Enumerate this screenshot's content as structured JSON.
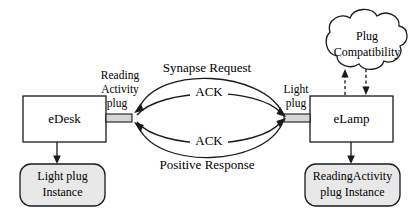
{
  "diagram": {
    "colors": {
      "stroke": "#1a1a1a",
      "box_fill": "#ffffff",
      "instance_fill": "#e8e8e8",
      "plug_fill": "#d6d6d6",
      "background": "#ffffff"
    },
    "components": [
      {
        "id": "edesk",
        "label": "eDesk",
        "shape": "rectangle"
      },
      {
        "id": "elamp",
        "label": "eLamp",
        "shape": "rectangle"
      }
    ],
    "instances": [
      {
        "id": "light-plug-instance",
        "line1": "Light plug",
        "line2": "Instance",
        "shape": "rounded-rectangle"
      },
      {
        "id": "reading-activity-plug-instance",
        "line1": "ReadingActivity",
        "line2": "plug Instance",
        "shape": "rounded-rectangle"
      }
    ],
    "cloud": {
      "id": "plug-compatibility",
      "line1": "Plug",
      "line2": "Compatibility",
      "shape": "cloud"
    },
    "plugs": [
      {
        "id": "reading-activity-plug",
        "line1": "Reading",
        "line2": "Activity",
        "line3": "plug",
        "attached_to": "edesk"
      },
      {
        "id": "light-plug",
        "line1": "Light",
        "line2": "plug",
        "attached_to": "elamp"
      }
    ],
    "messages": [
      {
        "id": "synapse-request",
        "label": "Synapse Request",
        "direction": "right-to-left",
        "position": "outer-top"
      },
      {
        "id": "ack-top",
        "label": "ACK",
        "direction": "left-to-right",
        "position": "inner-top"
      },
      {
        "id": "ack-bottom",
        "label": "ACK",
        "direction": "left-to-right",
        "position": "inner-bottom"
      },
      {
        "id": "positive-response",
        "label": "Positive Response",
        "direction": "right-to-left",
        "position": "outer-bottom"
      }
    ],
    "cloud_links": [
      {
        "id": "cloud-link-up",
        "style": "dashed",
        "direction": "up-into-cloud"
      },
      {
        "id": "cloud-link-down",
        "style": "dashed",
        "direction": "down-to-elamp"
      }
    ]
  }
}
